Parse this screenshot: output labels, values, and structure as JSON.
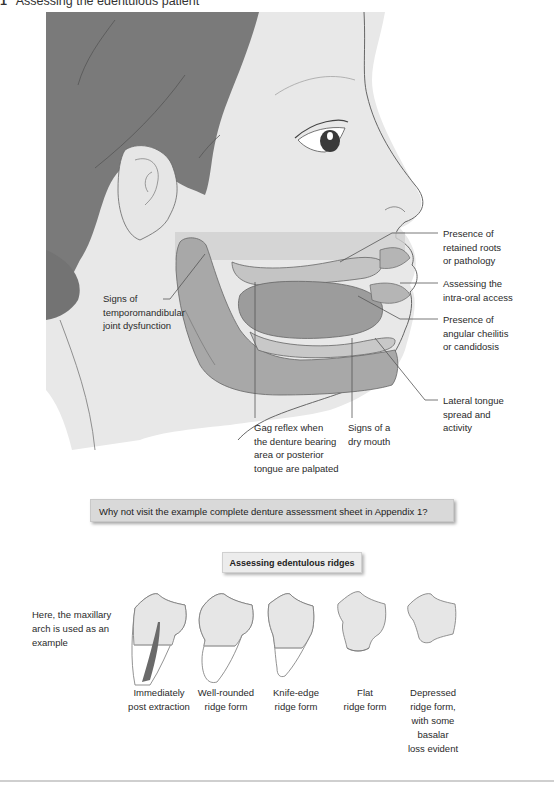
{
  "header": {
    "number": "1",
    "title": "Assessing the edentulous patient"
  },
  "illustration": {
    "alt": "Profile of head showing oral structures",
    "colors": {
      "hair": "#7a7a7a",
      "skin": "#e6e6e6",
      "tissue": "#a8a8a8",
      "tongue": "#9c9c9c",
      "outline": "#555555"
    },
    "labels": {
      "tmj": "Signs of temporomandibular joint dysfunction",
      "retained_roots": "Presence of retained roots or pathology",
      "intra_oral_access": "Assessing the intra-oral access",
      "angular_cheilitis": "Presence of angular cheilitis or candidosis",
      "lateral_tongue": "Lateral tongue spread and activity",
      "gag_reflex": "Gag reflex when the denture bearing area or posterior tongue are palpated",
      "dry_mouth": "Signs of a dry mouth"
    },
    "label_lines": {
      "tmj": [
        "Signs of",
        "temporomandibular",
        "joint dysfunction"
      ],
      "retained_roots": [
        "Presence of",
        "retained roots",
        "or pathology"
      ],
      "intra_oral_access": [
        "Assessing the",
        "intra-oral access"
      ],
      "angular_cheilitis": [
        "Presence of",
        "angular cheilitis",
        "or candidosis"
      ],
      "lateral_tongue": [
        "Lateral tongue",
        "spread and",
        "activity"
      ],
      "gag_reflex": [
        "Gag reflex when",
        "the denture bearing",
        "area or posterior",
        "tongue are palpated"
      ],
      "dry_mouth": [
        "Signs of a",
        "dry mouth"
      ]
    }
  },
  "callout": {
    "text": "Why not visit the example complete denture assessment sheet in Appendix 1?"
  },
  "ridges_section": {
    "title": "Assessing edentulous ridges",
    "side_note": "Here, the maxillary arch is used as an example",
    "items": [
      {
        "label": "Immediately post extraction",
        "lines": [
          "Immediately",
          "post extraction"
        ]
      },
      {
        "label": "Well-rounded ridge form",
        "lines": [
          "Well-rounded",
          "ridge form"
        ]
      },
      {
        "label": "Knife-edge ridge form",
        "lines": [
          "Knife-edge",
          "ridge form"
        ]
      },
      {
        "label": "Flat ridge form",
        "lines": [
          "Flat",
          "ridge form"
        ]
      },
      {
        "label": "Depressed ridge form, with some basalar loss evident",
        "lines": [
          "Depressed",
          "ridge form,",
          "with some",
          "basalar",
          "loss evident"
        ]
      }
    ]
  }
}
